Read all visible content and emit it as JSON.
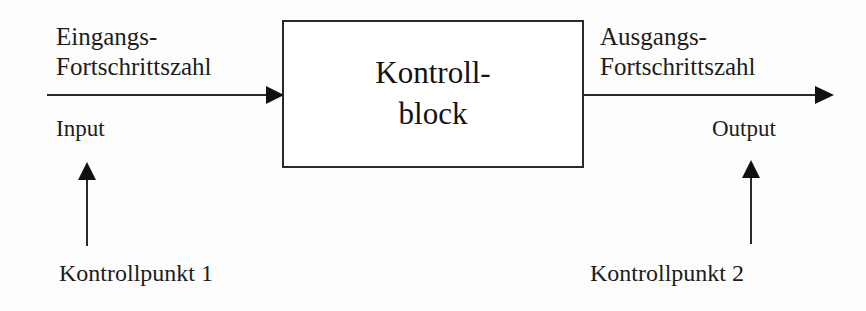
{
  "diagram": {
    "background_color": "#fdfdfd",
    "stroke_color": "#2a2a2a",
    "text_color": "#1a1a1a",
    "block": {
      "line1": "Kontroll-",
      "line2": "block"
    },
    "input": {
      "flow_line1": "Eingangs-",
      "flow_line2": "Fortschrittszahl",
      "io_label": "Input",
      "checkpoint_label": "Kontrollpunkt 1"
    },
    "output": {
      "flow_line1": "Ausgangs-",
      "flow_line2": "Fortschrittszahl",
      "io_label": "Output",
      "checkpoint_label": "Kontrollpunkt 2"
    },
    "arrows": {
      "input_flow": "arrow-right-icon",
      "output_flow": "arrow-right-icon",
      "checkpoint_1": "arrow-up-icon",
      "checkpoint_2": "arrow-up-icon"
    }
  }
}
